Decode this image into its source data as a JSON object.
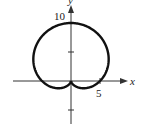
{
  "chart_data": {
    "type": "line",
    "title": "",
    "xlabel": "x",
    "ylabel": "y",
    "curve": "polar r = 5 + 5 sin(theta) (cardioid)",
    "x_ticks": [
      5
    ],
    "y_ticks": [
      -5,
      5,
      10
    ],
    "tick_labels": {
      "x": [
        "5"
      ],
      "y": [
        "10"
      ]
    },
    "xlim": [
      -12,
      12
    ],
    "ylim": [
      -9,
      12
    ],
    "grid": false,
    "legend": null,
    "series": [
      {
        "name": "r = 5 + 5 sin θ",
        "color": "#111111"
      }
    ]
  },
  "labels": {
    "x_axis": "x",
    "y_axis": "y",
    "y_tick_10": "10",
    "x_tick_5": "5"
  }
}
